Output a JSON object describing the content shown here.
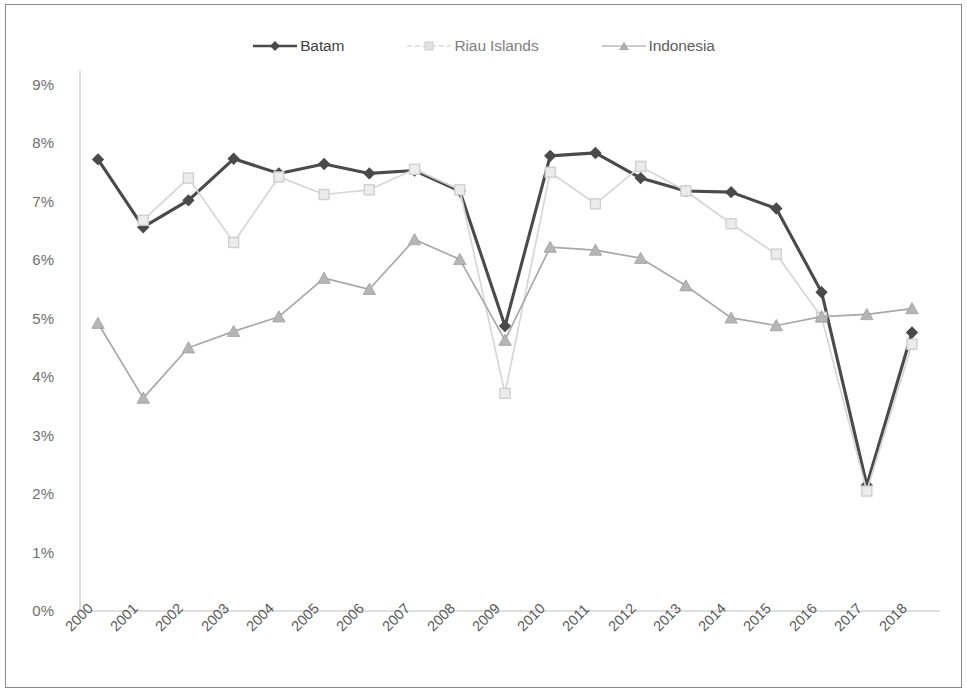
{
  "chart_data": {
    "type": "line",
    "title": "",
    "subtitle": "",
    "xlabel": "",
    "ylabel": "",
    "categories": [
      "2000",
      "2001",
      "2002",
      "2003",
      "2004",
      "2005",
      "2006",
      "2007",
      "2008",
      "2009",
      "2010",
      "2011",
      "2012",
      "2013",
      "2014",
      "2015",
      "2016",
      "2017",
      "2018"
    ],
    "ylim": [
      0,
      9
    ],
    "ytick_labels": [
      "0%",
      "1%",
      "2%",
      "3%",
      "4%",
      "5%",
      "6%",
      "7%",
      "8%",
      "9%"
    ],
    "ytick_values": [
      0,
      1,
      2,
      3,
      4,
      5,
      6,
      7,
      8,
      9
    ],
    "value_format": "percent",
    "grid": false,
    "legend_position": "top-center",
    "series": [
      {
        "name": "Batam",
        "color": "#4a4a4a",
        "marker": "diamond",
        "values": [
          7.72,
          6.56,
          7.02,
          7.73,
          7.48,
          7.64,
          7.48,
          7.53,
          7.18,
          4.87,
          7.78,
          7.83,
          7.4,
          7.18,
          7.16,
          6.88,
          5.45,
          2.15,
          4.76
        ]
      },
      {
        "name": "Riau Islands",
        "color": "#d6d6d6",
        "marker": "square",
        "values": [
          null,
          6.68,
          7.4,
          6.3,
          7.42,
          7.12,
          7.2,
          7.55,
          7.2,
          3.72,
          7.5,
          6.96,
          7.6,
          7.18,
          6.62,
          6.1,
          5.02,
          2.05,
          4.56
        ]
      },
      {
        "name": "Indonesia",
        "color": "#a8a8a8",
        "marker": "triangle",
        "values": [
          4.92,
          3.64,
          4.5,
          4.78,
          5.03,
          5.69,
          5.5,
          6.35,
          6.01,
          4.63,
          6.22,
          6.17,
          6.03,
          5.56,
          5.01,
          4.88,
          5.03,
          5.07,
          5.17
        ]
      }
    ]
  },
  "legend": {
    "items": [
      {
        "label": "Batam",
        "marker": "diamond",
        "color": "#4a4a4a"
      },
      {
        "label": "Riau Islands",
        "marker": "square",
        "color": "#d6d6d6"
      },
      {
        "label": "Indonesia",
        "marker": "triangle",
        "color": "#a8a8a8"
      }
    ]
  }
}
